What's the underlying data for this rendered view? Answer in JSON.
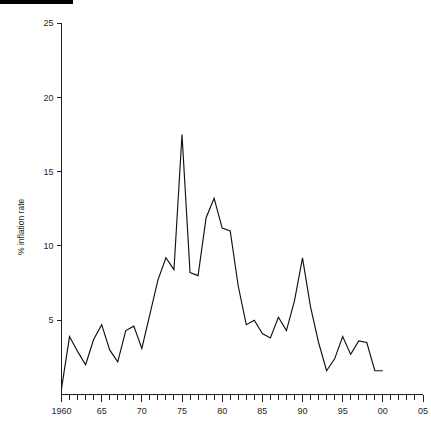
{
  "figure": {
    "top_rule": "black-header-rule"
  },
  "chart_data": {
    "type": "line",
    "title": "",
    "xlabel": "",
    "ylabel": "% inflation rate",
    "xlim": [
      1960,
      2005
    ],
    "ylim": [
      0,
      25
    ],
    "grid": false,
    "legend": "none",
    "y_ticks": [
      5,
      10,
      15,
      20,
      25
    ],
    "y_tick_labels": [
      "5",
      "10",
      "15",
      "20",
      "25"
    ],
    "x_ticks": [
      1960,
      1961,
      1962,
      1963,
      1964,
      1965,
      1966,
      1967,
      1968,
      1969,
      1970,
      1971,
      1972,
      1973,
      1974,
      1975,
      1976,
      1977,
      1978,
      1979,
      1980,
      1981,
      1982,
      1983,
      1984,
      1985,
      1986,
      1987,
      1988,
      1989,
      1990,
      1991,
      1992,
      1993,
      1994,
      1995,
      1996,
      1997,
      1998,
      1999,
      2000,
      2001,
      2002,
      2003,
      2004,
      2005
    ],
    "x_tick_labels": [
      "1960",
      "65",
      "70",
      "75",
      "80",
      "85",
      "90",
      "95",
      "00",
      "05"
    ],
    "x_labelled_ticks": [
      1960,
      1965,
      1970,
      1975,
      1980,
      1985,
      1990,
      1995,
      2000,
      2005
    ],
    "series": [
      {
        "name": "% inflation rate",
        "color": "#111111",
        "x": [
          1960,
          1961,
          1962,
          1963,
          1964,
          1965,
          1966,
          1967,
          1968,
          1969,
          1970,
          1971,
          1972,
          1973,
          1974,
          1975,
          1976,
          1977,
          1978,
          1979,
          1980,
          1981,
          1982,
          1983,
          1984,
          1985,
          1986,
          1987,
          1988,
          1989,
          1990,
          1991,
          1992,
          1993,
          1994,
          1995,
          1996,
          1997,
          1998,
          1999,
          2000
        ],
        "values": [
          0.4,
          3.9,
          2.9,
          2.0,
          3.7,
          4.7,
          3.0,
          2.2,
          4.3,
          4.6,
          3.1,
          5.4,
          7.7,
          9.2,
          8.4,
          17.5,
          8.2,
          8.0,
          11.9,
          13.2,
          11.2,
          11.0,
          7.3,
          4.7,
          5.0,
          4.1,
          3.8,
          5.2,
          4.3,
          6.3,
          9.2,
          5.9,
          3.5,
          1.6,
          2.4,
          3.9,
          2.7,
          3.6,
          3.5,
          1.6,
          1.6
        ]
      }
    ]
  }
}
